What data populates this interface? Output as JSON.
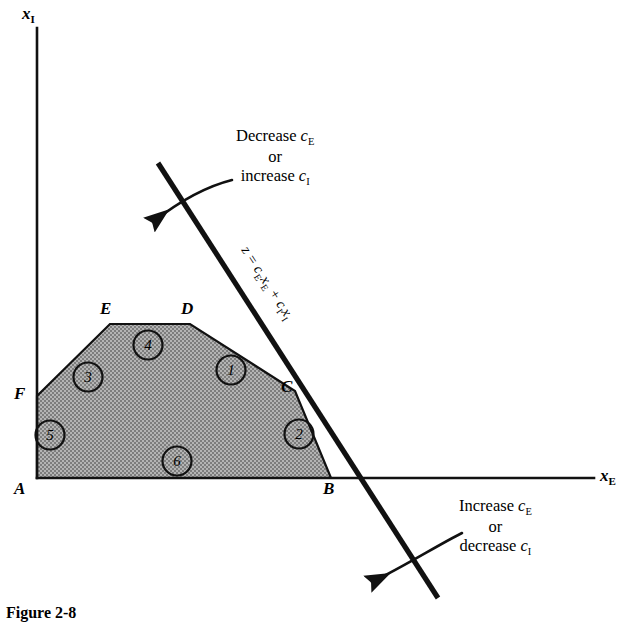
{
  "figure": {
    "type": "linear-programming-feasible-region",
    "background_color": "#ffffff",
    "ink_color": "#111111",
    "region_fill_color": "#9a9a9a",
    "caption": "Figure 2-8"
  },
  "axes": {
    "x_axis": {
      "name": "horizontal-axis",
      "label_main": "x",
      "label_sub": "E"
    },
    "y_axis": {
      "name": "vertical-axis",
      "label_main": "x",
      "label_sub": "I"
    }
  },
  "vertices": [
    {
      "id": "A",
      "label": "A",
      "x": 37,
      "y": 478,
      "label_x": 14,
      "label_y": 480
    },
    {
      "id": "B",
      "label": "B",
      "x": 331,
      "y": 478,
      "label_x": 324,
      "label_y": 480
    },
    {
      "id": "C",
      "label": "C",
      "x": 295,
      "y": 391,
      "label_x": 281,
      "label_y": 380
    },
    {
      "id": "D",
      "label": "D",
      "x": 190,
      "y": 324,
      "label_x": 182,
      "label_y": 302
    },
    {
      "id": "E",
      "label": "E",
      "x": 110,
      "y": 324,
      "label_x": 100,
      "label_y": 302
    },
    {
      "id": "F",
      "label": "F",
      "x": 37,
      "y": 396,
      "label_x": 14,
      "label_y": 386
    }
  ],
  "constraint_markers": [
    {
      "number": "1",
      "cx": 231,
      "cy": 370
    },
    {
      "number": "2",
      "cx": 299,
      "cy": 434
    },
    {
      "number": "3",
      "cx": 88,
      "cy": 377
    },
    {
      "number": "4",
      "cx": 148,
      "cy": 345
    },
    {
      "number": "5",
      "cx": 50,
      "cy": 435
    },
    {
      "number": "6",
      "cx": 177,
      "cy": 461
    }
  ],
  "objective_line": {
    "name": "objective-function-line",
    "equation_text": "z = c",
    "equation_sub_1": "E",
    "equation_mid": "x",
    "equation_sub_2": "E",
    "equation_plus": " + c",
    "equation_sub_3": "I",
    "equation_tail": "x",
    "equation_sub_4": "I",
    "equation_full": "z = cExE + cIxI",
    "start": {
      "x": 158,
      "y": 163
    },
    "end": {
      "x": 438,
      "y": 598
    }
  },
  "annotations": [
    {
      "name": "decrease-ce-annotation",
      "line1_a": "Decrease ",
      "line1_var": "c",
      "line1_sub": "E",
      "line2": "or",
      "line3_a": "increase ",
      "line3_var": "c",
      "line3_sub": "I",
      "text_x": 236,
      "text_y": 127
    },
    {
      "name": "increase-ce-annotation",
      "line1_a": "Increase ",
      "line1_var": "c",
      "line1_sub": "E",
      "line2": "or",
      "line3_a": "decrease ",
      "line3_var": "c",
      "line3_sub": "I",
      "text_x": 459,
      "text_y": 497
    }
  ],
  "arrows": [
    {
      "name": "upper-rotation-arrow",
      "direction": "down-left"
    },
    {
      "name": "lower-rotation-arrow",
      "direction": "down-left"
    }
  ]
}
